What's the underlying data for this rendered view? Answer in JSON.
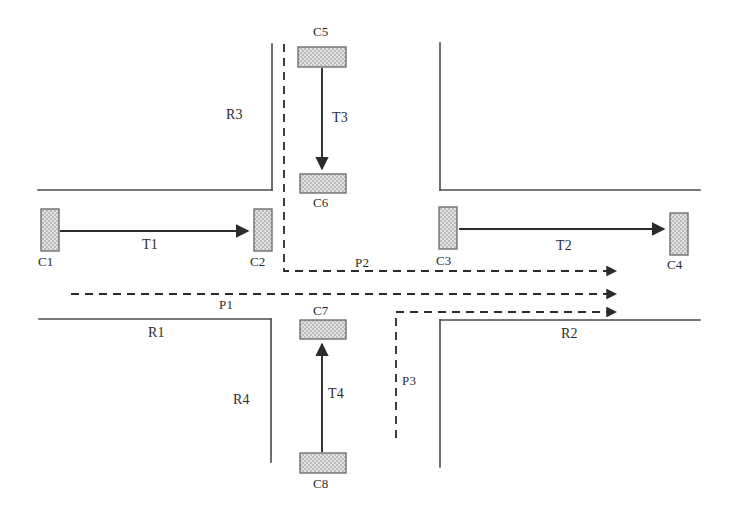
{
  "figure": {
    "type": "diagram",
    "background_color": "#ffffff",
    "line_color": "#3a3a3a",
    "car_fill": "#d9d9d9",
    "car_border": "#6f6f6f"
  },
  "cars": [
    {
      "id": "C1",
      "label": "C1",
      "orientation": "vertical",
      "x": 41,
      "y": 209,
      "w": 18,
      "h": 42
    },
    {
      "id": "C2",
      "label": "C2",
      "orientation": "vertical",
      "x": 254,
      "y": 209,
      "w": 18,
      "h": 42
    },
    {
      "id": "C3",
      "label": "C3",
      "orientation": "vertical",
      "x": 439,
      "y": 207,
      "w": 18,
      "h": 42
    },
    {
      "id": "C4",
      "label": "C4",
      "orientation": "vertical",
      "x": 670,
      "y": 213,
      "w": 18,
      "h": 42
    },
    {
      "id": "C5",
      "label": "C5",
      "orientation": "horizontal",
      "x": 298,
      "y": 47,
      "w": 48,
      "h": 20
    },
    {
      "id": "C6",
      "label": "C6",
      "orientation": "horizontal",
      "x": 300,
      "y": 174,
      "w": 46,
      "h": 19
    },
    {
      "id": "C7",
      "label": "C7",
      "orientation": "horizontal",
      "x": 300,
      "y": 320,
      "w": 46,
      "h": 19
    },
    {
      "id": "C8",
      "label": "C8",
      "orientation": "horizontal",
      "x": 300,
      "y": 453,
      "w": 46,
      "h": 20
    }
  ],
  "trajectories": [
    {
      "id": "T1",
      "label": "T1",
      "from": "C1",
      "to": "C2",
      "direction": "right",
      "label_x": 142,
      "label_y": 237
    },
    {
      "id": "T2",
      "label": "T2",
      "from": "C3",
      "to": "C4",
      "direction": "right",
      "label_x": 556,
      "label_y": 240
    },
    {
      "id": "T3",
      "label": "T3",
      "from": "C5",
      "to": "C6",
      "direction": "down",
      "label_x": 334,
      "label_y": 113
    },
    {
      "id": "T4",
      "label": "T4",
      "from": "C8",
      "to": "C7",
      "direction": "up",
      "label_x": 330,
      "label_y": 390
    }
  ],
  "paths": [
    {
      "id": "P1",
      "label": "P1",
      "style": "dashed",
      "label_x": 219,
      "label_y": 300
    },
    {
      "id": "P2",
      "label": "P2",
      "style": "dashed",
      "label_x": 355,
      "label_y": 259
    },
    {
      "id": "P3",
      "label": "P3",
      "style": "dashed",
      "label_x": 402,
      "label_y": 377
    }
  ],
  "roads": [
    {
      "id": "R1",
      "label": "R1",
      "label_x": 150,
      "label_y": 328
    },
    {
      "id": "R2",
      "label": "R2",
      "label_x": 563,
      "label_y": 329
    },
    {
      "id": "R3",
      "label": "R3",
      "label_x": 228,
      "label_y": 111
    },
    {
      "id": "R4",
      "label": "R4",
      "label_x": 235,
      "label_y": 396
    }
  ],
  "car_labels": {
    "C1": {
      "x": 38,
      "y": 254
    },
    "C2": {
      "x": 250,
      "y": 254
    },
    "C3": {
      "x": 436,
      "y": 253
    },
    "C4": {
      "x": 667,
      "y": 257
    },
    "C5": {
      "x": 313,
      "y": 26
    },
    "C6": {
      "x": 313,
      "y": 195
    },
    "C7": {
      "x": 313,
      "y": 304
    },
    "C8": {
      "x": 313,
      "y": 476
    }
  }
}
